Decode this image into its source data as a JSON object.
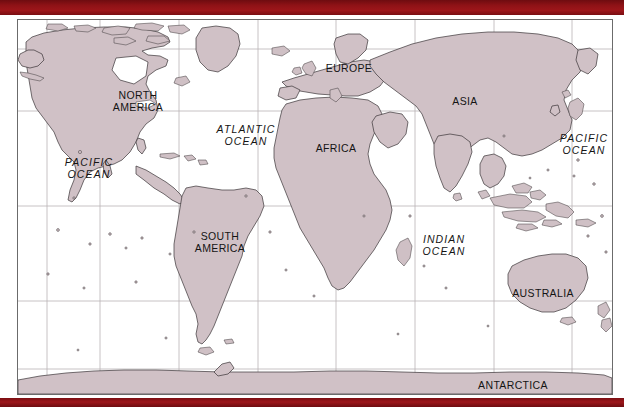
{
  "page": {
    "width": 624,
    "height": 407,
    "background_color": "#ffffff"
  },
  "banner": {
    "color": "#8b1014",
    "top_label": "",
    "bottom_label": ""
  },
  "map": {
    "projection": "equirectangular",
    "ocean_color": "#ffffff",
    "land_color": "#d0c1c6",
    "coastline_color": "#3a3436",
    "graticule_color": "#b9b2b5",
    "frame_color": "#6b6b6b",
    "graticule": {
      "vertical_x": [
        29,
        82,
        161,
        240,
        318,
        397,
        476,
        554
      ],
      "horizontal_y": [
        29,
        91,
        186,
        281,
        349
      ]
    },
    "labels": [
      {
        "name": "north-america",
        "kind": "continent",
        "lines": [
          "NORTH",
          "AMERICA"
        ],
        "x": 120,
        "y": 81
      },
      {
        "name": "south-america",
        "kind": "continent",
        "lines": [
          "SOUTH",
          "AMERICA"
        ],
        "x": 202,
        "y": 222
      },
      {
        "name": "europe",
        "kind": "continent",
        "lines": [
          "EUROPE"
        ],
        "x": 331,
        "y": 49
      },
      {
        "name": "africa",
        "kind": "continent",
        "lines": [
          "AFRICA"
        ],
        "x": 318,
        "y": 129
      },
      {
        "name": "asia",
        "kind": "continent",
        "lines": [
          "ASIA"
        ],
        "x": 447,
        "y": 82
      },
      {
        "name": "australia",
        "kind": "continent",
        "lines": [
          "AUSTRALIA"
        ],
        "x": 525,
        "y": 274
      },
      {
        "name": "antarctica",
        "kind": "continent",
        "lines": [
          "ANTARCTICA"
        ],
        "x": 495,
        "y": 366
      },
      {
        "name": "pacific-ocean-west",
        "kind": "ocean",
        "lines": [
          "PACIFIC",
          "OCEAN"
        ],
        "x": 71,
        "y": 148
      },
      {
        "name": "atlantic-ocean",
        "kind": "ocean",
        "lines": [
          "ATLANTIC",
          "OCEAN"
        ],
        "x": 228,
        "y": 115
      },
      {
        "name": "indian-ocean",
        "kind": "ocean",
        "lines": [
          "INDIAN",
          "OCEAN"
        ],
        "x": 426,
        "y": 225
      },
      {
        "name": "pacific-ocean-east",
        "kind": "ocean",
        "lines": [
          "PACIFIC",
          "OCEAN"
        ],
        "x": 566,
        "y": 124
      }
    ]
  }
}
